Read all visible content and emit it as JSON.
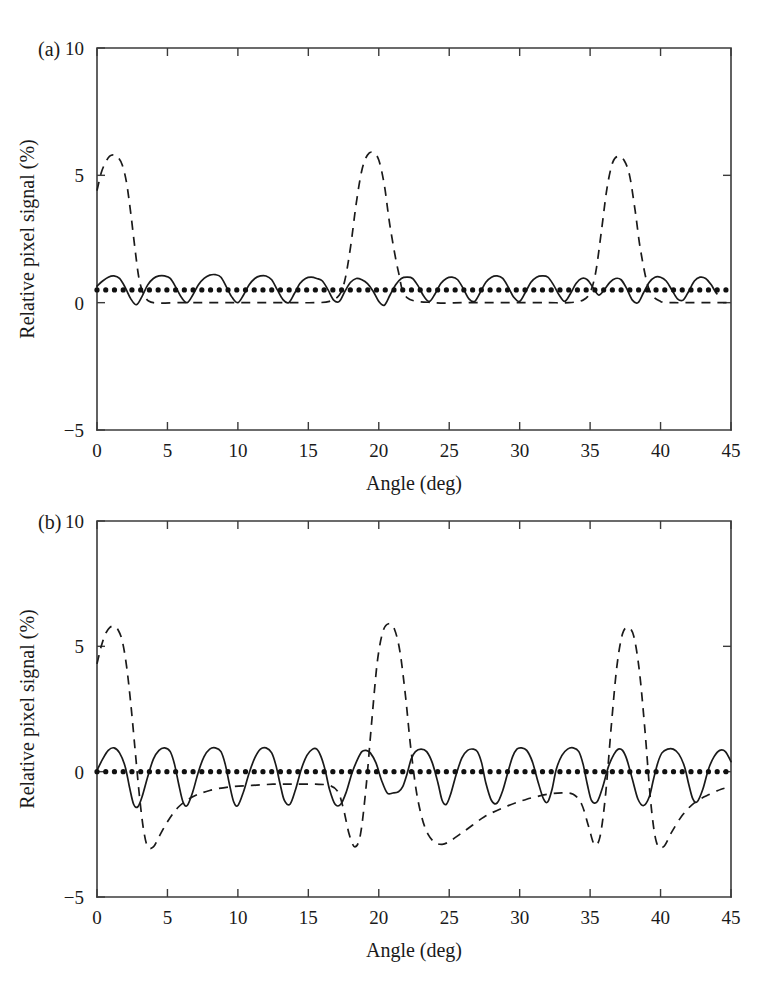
{
  "figure": {
    "type": "multi-panel-line-chart",
    "panels": [
      "a",
      "b"
    ]
  },
  "chart_data": [
    {
      "type": "line",
      "panel_label": "(a)",
      "title": "",
      "xlabel": "Angle (deg)",
      "ylabel": "Relative pixel signal (%)",
      "xlim": [
        0,
        45
      ],
      "ylim": [
        -5,
        10
      ],
      "xticks": [
        0,
        5,
        10,
        15,
        20,
        25,
        30,
        35,
        40,
        45
      ],
      "xticklabels": [
        "0",
        "5",
        "10",
        "15",
        "20",
        "25",
        "30",
        "35",
        "40",
        "45"
      ],
      "yticks": [
        -5,
        0,
        5,
        10
      ],
      "yticklabels": [
        "-5",
        "0",
        "5",
        "10"
      ],
      "grid": false,
      "legend": "none",
      "series": [
        {
          "name": "solid-curve",
          "style": "solid",
          "comment": "oscillating ripple, period approx 2.8 deg, between about -0.1 and 1.1 percent",
          "x": [
            0.0,
            0.4,
            0.8,
            1.2,
            1.6,
            2.0,
            2.4,
            2.8,
            3.2,
            3.6,
            4.0,
            4.4,
            4.8,
            5.2,
            5.6,
            6.0,
            6.4,
            6.8,
            7.2,
            7.6,
            8.0,
            8.4,
            8.8,
            9.2,
            9.6,
            10.0,
            10.4,
            10.8,
            11.2,
            11.6,
            12.0,
            12.4,
            12.8,
            13.2,
            13.6,
            14.0,
            14.4,
            14.8,
            15.2,
            15.6,
            16.0,
            16.4,
            16.8,
            17.2,
            17.6,
            18.0,
            18.4,
            18.8,
            19.2,
            19.6,
            20.0,
            20.4,
            20.8,
            21.2,
            21.6,
            22.0,
            22.4,
            22.8,
            23.2,
            23.6,
            24.0,
            24.4,
            24.8,
            25.2,
            25.6,
            26.0,
            26.4,
            26.8,
            27.2,
            27.6,
            28.0,
            28.4,
            28.8,
            29.2,
            29.6,
            30.0,
            30.4,
            30.8,
            31.2,
            31.6,
            32.0,
            32.4,
            32.8,
            33.2,
            33.6,
            34.0,
            34.4,
            34.8,
            35.2,
            35.6,
            36.0,
            36.4,
            36.8,
            37.2,
            37.6,
            38.0,
            38.4,
            38.8,
            39.2,
            39.6,
            40.0,
            40.4,
            40.8,
            41.2,
            41.6,
            42.0,
            42.4,
            42.8,
            43.2,
            43.6,
            44.0,
            44.4,
            45.0
          ],
          "y": [
            0.65,
            0.85,
            1.0,
            1.05,
            0.95,
            0.6,
            0.15,
            -0.08,
            0.25,
            0.7,
            0.95,
            1.05,
            1.05,
            0.95,
            0.6,
            0.2,
            0.0,
            0.3,
            0.7,
            0.95,
            1.08,
            1.1,
            1.0,
            0.6,
            0.2,
            0.0,
            0.3,
            0.7,
            0.95,
            1.05,
            1.05,
            0.9,
            0.5,
            0.12,
            0.0,
            0.35,
            0.75,
            0.95,
            1.0,
            0.95,
            0.85,
            0.5,
            0.1,
            0.05,
            0.45,
            0.8,
            0.95,
            0.9,
            0.75,
            0.45,
            0.05,
            -0.1,
            0.3,
            0.7,
            0.95,
            1.0,
            0.95,
            0.65,
            0.25,
            0.05,
            0.35,
            0.75,
            0.95,
            1.0,
            0.9,
            0.55,
            0.15,
            0.05,
            0.4,
            0.8,
            1.0,
            1.05,
            0.95,
            0.6,
            0.2,
            0.05,
            0.4,
            0.8,
            1.0,
            1.05,
            1.0,
            0.7,
            0.3,
            0.05,
            0.35,
            0.75,
            0.95,
            0.9,
            0.6,
            0.3,
            0.5,
            0.8,
            0.95,
            0.9,
            0.55,
            0.1,
            0.0,
            0.4,
            0.8,
            1.0,
            1.0,
            0.85,
            0.5,
            0.15,
            0.1,
            0.45,
            0.85,
            1.0,
            0.95,
            0.7,
            0.35,
            0.3
          ]
        },
        {
          "name": "dashed-curve",
          "style": "dashed",
          "comment": "near-zero baseline with three tall peaks reaching about 5.8 percent near 1, 18.8 and 36.4 degrees",
          "x": [
            0.0,
            0.3,
            0.6,
            0.9,
            1.2,
            1.5,
            1.8,
            2.1,
            2.4,
            2.7,
            3.0,
            3.4,
            4.0,
            6.0,
            8.0,
            10.0,
            12.0,
            14.0,
            15.5,
            16.5,
            17.2,
            17.6,
            18.0,
            18.4,
            18.8,
            19.2,
            19.6,
            20.0,
            20.4,
            20.8,
            21.4,
            22.0,
            24.0,
            26.0,
            28.0,
            30.0,
            32.0,
            33.5,
            34.5,
            35.0,
            35.4,
            35.8,
            36.2,
            36.6,
            37.0,
            37.4,
            37.8,
            38.2,
            38.6,
            39.2,
            40.0,
            41.0,
            42.0,
            43.0,
            44.0,
            45.0
          ],
          "y": [
            4.4,
            5.1,
            5.5,
            5.75,
            5.8,
            5.7,
            5.4,
            4.7,
            3.5,
            2.1,
            0.9,
            0.25,
            0.0,
            0.0,
            0.0,
            0.0,
            0.0,
            0.0,
            0.0,
            0.05,
            0.3,
            0.9,
            2.2,
            3.9,
            5.2,
            5.8,
            5.9,
            5.6,
            4.6,
            3.0,
            1.2,
            0.2,
            0.0,
            0.0,
            0.0,
            0.0,
            0.0,
            0.0,
            0.1,
            0.4,
            1.2,
            2.8,
            4.5,
            5.5,
            5.75,
            5.6,
            5.0,
            3.6,
            2.0,
            0.5,
            0.05,
            0.0,
            0.0,
            0.0,
            0.0,
            0.0
          ]
        },
        {
          "name": "dotted-markers",
          "style": "dotted",
          "comment": "flat row of small dots at about 0.5 percent across the full range",
          "marker_spacing_deg": 0.62,
          "x_start": 0.0,
          "x_end": 45.0,
          "y_level": 0.5
        }
      ]
    },
    {
      "type": "line",
      "panel_label": "(b)",
      "title": "",
      "xlabel": "Angle (deg)",
      "ylabel": "Relative pixel signal (%)",
      "xlim": [
        0,
        45
      ],
      "ylim": [
        -5,
        10
      ],
      "xticks": [
        0,
        5,
        10,
        15,
        20,
        25,
        30,
        35,
        40,
        45
      ],
      "xticklabels": [
        "0",
        "5",
        "10",
        "15",
        "20",
        "25",
        "30",
        "35",
        "40",
        "45"
      ],
      "yticks": [
        -5,
        0,
        5,
        10
      ],
      "yticklabels": [
        "-5",
        "0",
        "5",
        "10"
      ],
      "grid": false,
      "legend": "none",
      "series": [
        {
          "name": "solid-curve",
          "style": "solid",
          "comment": "symmetric ripple about zero, period approx 2.8 deg, between about -1.4 and 1.0 percent",
          "x": [
            0.0,
            0.4,
            0.8,
            1.2,
            1.6,
            2.0,
            2.3,
            2.6,
            2.9,
            3.2,
            3.6,
            4.0,
            4.4,
            4.8,
            5.2,
            5.5,
            5.8,
            6.1,
            6.4,
            6.8,
            7.2,
            7.6,
            8.0,
            8.4,
            8.8,
            9.1,
            9.4,
            9.7,
            10.0,
            10.4,
            10.8,
            11.2,
            11.6,
            12.0,
            12.4,
            12.7,
            13.0,
            13.3,
            13.7,
            14.1,
            14.5,
            14.9,
            15.3,
            15.6,
            15.9,
            16.2,
            16.5,
            16.9,
            17.3,
            17.7,
            18.1,
            18.5,
            18.8,
            19.1,
            19.4,
            19.8,
            20.2,
            20.6,
            21.0,
            21.4,
            21.7,
            22.0,
            22.3,
            22.6,
            23.0,
            23.4,
            23.8,
            24.2,
            24.5,
            24.8,
            25.1,
            25.5,
            25.9,
            26.3,
            26.7,
            27.0,
            27.3,
            27.6,
            28.0,
            28.4,
            28.8,
            29.2,
            29.5,
            29.8,
            30.1,
            30.5,
            30.9,
            31.3,
            31.7,
            32.0,
            32.3,
            32.6,
            33.0,
            33.4,
            33.8,
            34.2,
            34.5,
            34.8,
            35.1,
            35.5,
            35.9,
            36.3,
            36.7,
            37.0,
            37.3,
            37.6,
            38.0,
            38.4,
            38.8,
            39.2,
            39.5,
            39.8,
            40.1,
            40.5,
            40.9,
            41.3,
            41.7,
            42.0,
            42.3,
            42.6,
            43.0,
            43.4,
            43.8,
            44.2,
            44.6,
            45.0
          ],
          "y": [
            0.05,
            0.5,
            0.85,
            0.95,
            0.75,
            0.2,
            -0.6,
            -1.3,
            -1.4,
            -1.0,
            -0.2,
            0.5,
            0.85,
            0.95,
            0.8,
            0.3,
            -0.5,
            -1.2,
            -1.35,
            -0.8,
            0.0,
            0.6,
            0.9,
            0.95,
            0.8,
            0.3,
            -0.5,
            -1.2,
            -1.35,
            -0.8,
            -0.05,
            0.55,
            0.9,
            0.95,
            0.75,
            0.25,
            -0.5,
            -1.15,
            -1.3,
            -0.7,
            0.1,
            0.65,
            0.9,
            0.9,
            0.6,
            0.05,
            -0.7,
            -1.3,
            -1.3,
            -0.8,
            -0.05,
            0.5,
            0.8,
            0.85,
            0.75,
            0.35,
            -0.35,
            -0.85,
            -0.85,
            -0.8,
            -0.6,
            -0.1,
            0.5,
            0.8,
            0.9,
            0.8,
            0.35,
            -0.45,
            -1.15,
            -1.3,
            -0.9,
            -0.1,
            0.55,
            0.85,
            0.9,
            0.8,
            0.35,
            -0.45,
            -1.15,
            -1.25,
            -0.75,
            0.05,
            0.6,
            0.9,
            0.95,
            0.85,
            0.4,
            -0.4,
            -1.1,
            -1.2,
            -0.7,
            0.1,
            0.65,
            0.9,
            0.95,
            0.8,
            0.3,
            -0.5,
            -1.15,
            -1.2,
            -0.6,
            0.2,
            0.7,
            0.9,
            0.85,
            0.5,
            -0.3,
            -1.1,
            -1.35,
            -1.0,
            -0.3,
            0.35,
            0.75,
            0.9,
            0.9,
            0.7,
            0.2,
            -0.5,
            -1.1,
            -1.2,
            -0.7,
            0.1,
            0.6,
            0.85,
            0.8,
            0.4,
            0.0
          ]
        },
        {
          "name": "dashed-curve",
          "style": "dashed",
          "comment": "three tall peaks to about 5.8 percent with deep troughs down to about -3 percent and slow negative baseline near -0.6",
          "x": [
            0.0,
            0.3,
            0.6,
            0.9,
            1.2,
            1.5,
            1.8,
            2.1,
            2.4,
            2.7,
            3.0,
            3.3,
            3.6,
            4.0,
            4.4,
            5.0,
            5.8,
            6.8,
            8.0,
            9.5,
            11.0,
            12.5,
            14.0,
            15.5,
            16.5,
            17.1,
            17.5,
            17.9,
            18.3,
            18.7,
            19.1,
            19.5,
            19.9,
            20.3,
            20.7,
            21.1,
            21.5,
            21.9,
            22.3,
            22.8,
            23.5,
            24.5,
            26.0,
            27.5,
            29.0,
            30.5,
            32.0,
            33.0,
            33.8,
            34.4,
            34.9,
            35.3,
            35.7,
            36.1,
            36.5,
            36.9,
            37.3,
            37.7,
            38.1,
            38.5,
            38.9,
            39.3,
            39.7,
            40.2,
            40.8,
            41.6,
            42.5,
            43.5,
            44.3,
            45.0
          ],
          "y": [
            4.3,
            5.0,
            5.5,
            5.75,
            5.8,
            5.65,
            5.2,
            4.2,
            2.7,
            0.9,
            -0.9,
            -2.3,
            -3.0,
            -3.0,
            -2.6,
            -2.0,
            -1.4,
            -1.0,
            -0.75,
            -0.6,
            -0.55,
            -0.5,
            -0.5,
            -0.5,
            -0.55,
            -0.8,
            -1.5,
            -2.5,
            -3.0,
            -2.5,
            -0.6,
            2.0,
            4.4,
            5.6,
            5.9,
            5.7,
            4.8,
            3.0,
            0.8,
            -1.2,
            -2.5,
            -2.9,
            -2.4,
            -1.8,
            -1.4,
            -1.1,
            -0.9,
            -0.85,
            -0.9,
            -1.3,
            -2.2,
            -2.9,
            -2.6,
            -0.9,
            1.8,
            4.2,
            5.5,
            5.75,
            5.4,
            4.0,
            1.6,
            -1.2,
            -2.8,
            -3.0,
            -2.4,
            -1.7,
            -1.2,
            -0.9,
            -0.7,
            -0.6
          ]
        },
        {
          "name": "dotted-markers",
          "style": "dotted",
          "comment": "flat row of small dots at exactly 0 percent across the full range",
          "marker_spacing_deg": 0.62,
          "x_start": 0.0,
          "x_end": 45.0,
          "y_level": 0.0
        }
      ]
    }
  ],
  "colors": {
    "ink": "#1a1a1a",
    "axis": "#3b3b3b",
    "background": "#ffffff"
  }
}
